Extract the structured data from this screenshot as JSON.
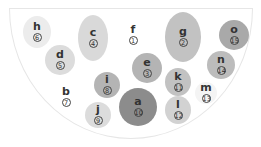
{
  "diagram": {
    "type": "bowl-bubble-diagram",
    "nodes": [
      {
        "id": "a",
        "label": "a",
        "number": "10",
        "x": 138,
        "y": 107,
        "w": 38,
        "h": 38,
        "color": "#8c8c8c"
      },
      {
        "id": "b",
        "label": "b",
        "number": "7",
        "x": 66,
        "y": 97,
        "w": 0,
        "h": 0,
        "color": "transparent"
      },
      {
        "id": "c",
        "label": "c",
        "number": "4",
        "x": 93,
        "y": 38,
        "w": 30,
        "h": 46,
        "color": "#d9d9d9"
      },
      {
        "id": "d",
        "label": "d",
        "number": "5",
        "x": 60,
        "y": 60,
        "w": 30,
        "h": 30,
        "color": "#dcdcdc"
      },
      {
        "id": "e",
        "label": "e",
        "number": "3",
        "x": 147,
        "y": 68,
        "w": 30,
        "h": 30,
        "color": "#b4b4b4"
      },
      {
        "id": "f",
        "label": "f",
        "number": "1",
        "x": 133,
        "y": 35,
        "w": 0,
        "h": 0,
        "color": "transparent"
      },
      {
        "id": "g",
        "label": "g",
        "number": "2",
        "x": 183,
        "y": 37,
        "w": 36,
        "h": 50,
        "color": "#c2c2c2"
      },
      {
        "id": "h",
        "label": "h",
        "number": "6",
        "x": 37,
        "y": 32,
        "w": 28,
        "h": 32,
        "color": "#ececec"
      },
      {
        "id": "i",
        "label": "i",
        "number": "8",
        "x": 107,
        "y": 85,
        "w": 26,
        "h": 26,
        "color": "#b4b4b4"
      },
      {
        "id": "j",
        "label": "j",
        "number": "9",
        "x": 98,
        "y": 115,
        "w": 26,
        "h": 26,
        "color": "#dcdcdc"
      },
      {
        "id": "k",
        "label": "k",
        "number": "11",
        "x": 178,
        "y": 82,
        "w": 26,
        "h": 28,
        "color": "#c2c2c2"
      },
      {
        "id": "l",
        "label": "l",
        "number": "12",
        "x": 178,
        "y": 110,
        "w": 26,
        "h": 28,
        "color": "#d2d2d2"
      },
      {
        "id": "m",
        "label": "m",
        "number": "13",
        "x": 206,
        "y": 93,
        "w": 22,
        "h": 22,
        "color": "#f4f4f4"
      },
      {
        "id": "n",
        "label": "n",
        "number": "14",
        "x": 221,
        "y": 65,
        "w": 28,
        "h": 28,
        "color": "#bcbcbc"
      },
      {
        "id": "o",
        "label": "o",
        "number": "15",
        "x": 234,
        "y": 35,
        "w": 30,
        "h": 30,
        "color": "#a9a9a9"
      }
    ]
  }
}
